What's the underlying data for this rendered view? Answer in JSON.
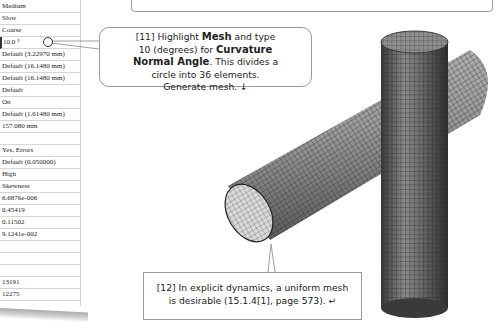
{
  "details_table": {
    "rows": [
      {
        "value": "Medium",
        "top": 0
      },
      {
        "value": "Slow",
        "top": 17
      },
      {
        "value": "Coarse",
        "top": 34
      },
      {
        "value": "10.0 °",
        "top": 51,
        "selected": true
      },
      {
        "value": "Default (3.22970 mm)",
        "top": 68
      },
      {
        "value": "Default (16.1480 mm)",
        "top": 85
      },
      {
        "value": "Default (16.1480 mm)",
        "top": 102
      },
      {
        "value": "Default",
        "top": 119
      },
      {
        "value": "On",
        "top": 136
      },
      {
        "value": "Default (1.61480 mm)",
        "top": 153
      },
      {
        "value": "157.080 mm",
        "top": 170
      },
      {
        "value": "",
        "top": 187
      },
      {
        "value": "Yes, Errors",
        "top": 204
      },
      {
        "value": "Default (0.050000)",
        "top": 221
      },
      {
        "value": "High",
        "top": 238
      },
      {
        "value": "Skewness",
        "top": 255
      },
      {
        "value": "6.6876e-006",
        "top": 272
      },
      {
        "value": "0.45419",
        "top": 289
      }
    ]
  },
  "details_table_lower": {
    "rows": [
      {
        "value": "0.11502"
      },
      {
        "value": "9.1241e-002"
      },
      {
        "value": ""
      },
      {
        "value": ""
      },
      {
        "value": ""
      },
      {
        "value": "13191"
      },
      {
        "value": "12275"
      }
    ]
  },
  "callout_11": {
    "line1_pre": "[11] Highlight ",
    "line1_bold": "Mesh",
    "line1_post": " and type",
    "line2_pre": "10 (degrees) for ",
    "line2_bold": "Curvature",
    "line3_bold": "Normal Angle",
    "line3_post": ". This divides a",
    "line4": "circle into 36 elements.",
    "line5": "Generate mesh. ↓"
  },
  "callout_12": {
    "line1": "[12] In explicit dynamics, a uniform mesh",
    "line2": "is desirable (15.1.4[1], page 573).  ↵"
  },
  "viewport": {
    "model": "meshed-intersecting-cylinders",
    "mesh_color": "#2a2a2a",
    "surface_color": "#9a9a9a"
  }
}
